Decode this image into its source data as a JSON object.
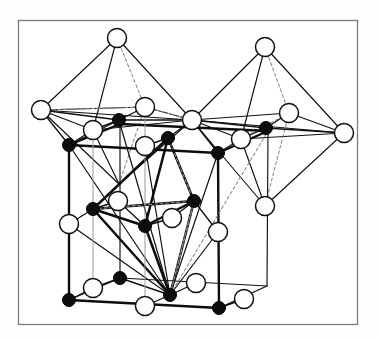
{
  "figure": {
    "caption": "",
    "frame": {
      "x": 18,
      "y": 20,
      "width": 340,
      "height": 305,
      "stroke": "#7d7d7d",
      "stroke_width": 1.2,
      "fill": "#ffffff"
    },
    "style": {
      "background": "#ffffff",
      "line_color": "#111111",
      "dashed_color": "#8a8a8a",
      "open_circle_fill": "#ffffff",
      "open_circle_stroke": "#111111",
      "filled_circle_fill": "#0d0d0d",
      "filled_circle_stroke": "#000000",
      "thin_stroke": 1.1,
      "thick_stroke": 2.6,
      "dash_pattern": "3,2.5"
    },
    "legend": {
      "open_circle_label": "anion (large open sphere)",
      "filled_circle_label": "cation (small filled sphere)"
    },
    "atoms": {
      "open": [
        {
          "id": "O-L-apex",
          "x": 117,
          "y": 38,
          "r": 9.5
        },
        {
          "id": "O-L-left",
          "x": 41,
          "y": 110,
          "r": 9.5
        },
        {
          "id": "O-L-back",
          "x": 145,
          "y": 107,
          "r": 9.5
        },
        {
          "id": "O-L-front",
          "x": 93,
          "y": 130,
          "r": 9.5
        },
        {
          "id": "O-L-right",
          "x": 192,
          "y": 120,
          "r": 9.5
        },
        {
          "id": "O-R-apex",
          "x": 265,
          "y": 47,
          "r": 9.5
        },
        {
          "id": "O-R-back",
          "x": 289,
          "y": 113,
          "r": 9.5
        },
        {
          "id": "O-R-front",
          "x": 241,
          "y": 139,
          "r": 9.5
        },
        {
          "id": "O-R-right",
          "x": 344,
          "y": 133,
          "r": 9.5
        },
        {
          "id": "O-R-bottom",
          "x": 265,
          "y": 206,
          "r": 9.5
        },
        {
          "id": "O-C-top",
          "x": 145,
          "y": 146,
          "r": 9.5
        },
        {
          "id": "O-C-back",
          "x": 118,
          "y": 201,
          "r": 9.5
        },
        {
          "id": "O-C-front",
          "x": 172,
          "y": 218,
          "r": 9.5
        },
        {
          "id": "O-cellL-mid",
          "x": 69,
          "y": 224,
          "r": 9.5
        },
        {
          "id": "O-cellR-mid",
          "x": 218,
          "y": 232,
          "r": 9.5
        },
        {
          "id": "O-bot-backleft",
          "x": 93,
          "y": 288,
          "r": 9.5
        },
        {
          "id": "O-bot-backright",
          "x": 196,
          "y": 283,
          "r": 9.5
        },
        {
          "id": "O-bot-front",
          "x": 145,
          "y": 306,
          "r": 9.5
        },
        {
          "id": "O-bot-rightedge",
          "x": 244,
          "y": 299,
          "r": 9.5
        }
      ],
      "filled": [
        {
          "id": "M-L-center",
          "x": 119,
          "y": 120,
          "r": 6.5
        },
        {
          "id": "M-R-center",
          "x": 266,
          "y": 128,
          "r": 6.5
        },
        {
          "id": "M-cell-topleft",
          "x": 69,
          "y": 145,
          "r": 6.5
        },
        {
          "id": "M-cell-topmid",
          "x": 168,
          "y": 138,
          "r": 6.5
        },
        {
          "id": "M-cell-topright",
          "x": 218,
          "y": 153,
          "r": 6.5
        },
        {
          "id": "M-C-left",
          "x": 93,
          "y": 209,
          "r": 6.5
        },
        {
          "id": "M-C-right",
          "x": 194,
          "y": 201,
          "r": 6.5
        },
        {
          "id": "M-C-front",
          "x": 145,
          "y": 226,
          "r": 6.5
        },
        {
          "id": "M-cell-botleft",
          "x": 69,
          "y": 300,
          "r": 6.5
        },
        {
          "id": "M-cell-botback",
          "x": 120,
          "y": 278,
          "r": 6.5
        },
        {
          "id": "M-cell-botfront",
          "x": 170,
          "y": 295,
          "r": 6.5
        },
        {
          "id": "M-cell-botright",
          "x": 219,
          "y": 308,
          "r": 6.5
        }
      ]
    },
    "counts": {
      "open_circles": 19,
      "filled_circles": 12,
      "octahedra": 3
    }
  }
}
